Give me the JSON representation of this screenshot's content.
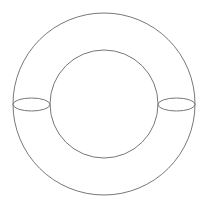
{
  "diagram": {
    "type": "torus-schematic",
    "stroke_color": "#777777",
    "background": "#ffffff",
    "outer_circle": {
      "cx": 104,
      "cy": 104,
      "r": 91
    },
    "inner_circle": {
      "cx": 104,
      "cy": 104,
      "r": 54
    },
    "meridians": [
      {
        "cx": 31.5,
        "cy": 104.5,
        "rx": 18.5,
        "ry": 6.5
      },
      {
        "cx": 176.5,
        "cy": 104.5,
        "rx": 18.5,
        "ry": 6.5
      }
    ]
  }
}
